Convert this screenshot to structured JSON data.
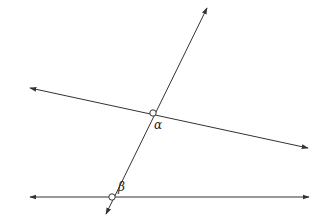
{
  "diagram": {
    "labels": {
      "alpha": "α",
      "beta": "β"
    },
    "colors": {
      "line": "#333333",
      "point_fill": "#ffffff"
    },
    "lines": [
      {
        "name": "transversal",
        "x1": 106,
        "y1": 214,
        "x2": 207,
        "y2": 8
      },
      {
        "name": "upper-line",
        "x1": 30,
        "y1": 88,
        "x2": 308,
        "y2": 148
      },
      {
        "name": "lower-line",
        "x1": 30,
        "y1": 197,
        "x2": 309,
        "y2": 197
      }
    ],
    "points": [
      {
        "name": "alpha-point",
        "cx": 153,
        "cy": 113
      },
      {
        "name": "beta-point",
        "cx": 112,
        "cy": 197
      }
    ]
  }
}
